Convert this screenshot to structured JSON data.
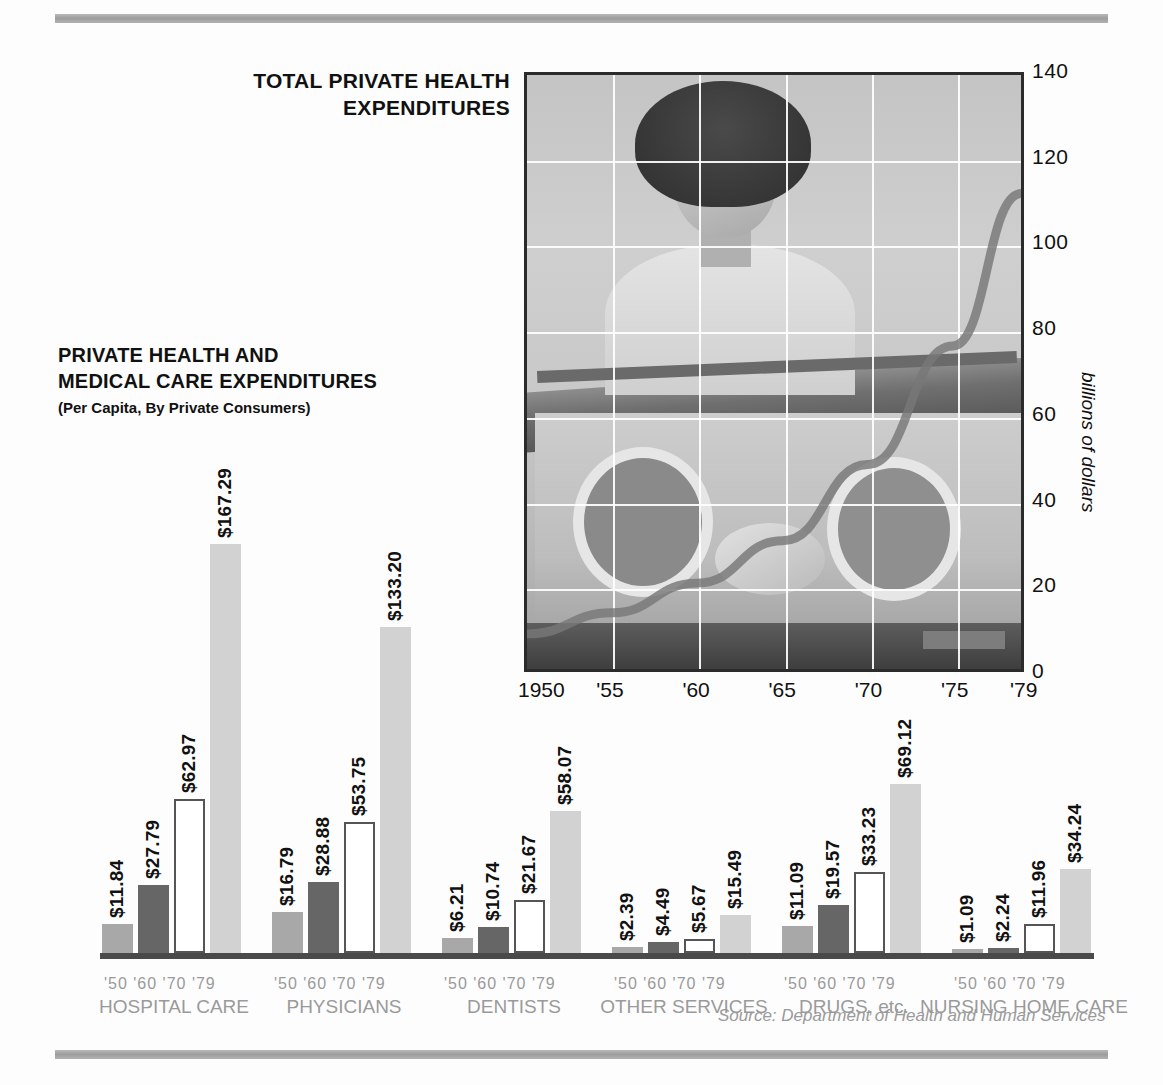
{
  "titles": {
    "line_chart_title": "TOTAL PRIVATE HEALTH EXPENDITURES",
    "bar_chart_title_line1": "PRIVATE HEALTH AND",
    "bar_chart_title_line2": "MEDICAL CARE EXPENDITURES",
    "bar_chart_subtitle": "(Per Capita, By Private Consumers)"
  },
  "source": "Source: Department of Health and Human Services",
  "colors": {
    "rule": "#a9a9a9",
    "frame": "#2b2b2b",
    "bar_1950": "#a8a8a8",
    "bar_1960": "#666666",
    "bar_1970": "#ffffff",
    "bar_1979": "#d2d2d2",
    "label_muted": "#9a9a9a",
    "text": "#111111"
  },
  "chart_data": [
    {
      "type": "line",
      "title": "TOTAL PRIVATE HEALTH EXPENDITURES",
      "xlabel": "",
      "ylabel": "billions of dollars",
      "xlim": [
        1950,
        1979
      ],
      "ylim": [
        0,
        140
      ],
      "yticks": [
        140,
        120,
        100,
        80,
        60,
        40,
        20,
        0
      ],
      "xticks": [
        "1950",
        "'55",
        "'60",
        "'65",
        "'70",
        "'75",
        "'79"
      ],
      "xtick_values": [
        1950,
        1955,
        1960,
        1965,
        1970,
        1975,
        1979
      ],
      "grid": true,
      "legend": "none",
      "series": [
        {
          "name": "Total private health expenditures",
          "x": [
            1950,
            1955,
            1960,
            1965,
            1970,
            1975,
            1979
          ],
          "values": [
            8,
            13,
            20,
            30,
            48,
            76,
            112
          ]
        }
      ],
      "background_image": "photo-nurse-with-infant-incubator"
    },
    {
      "type": "bar",
      "title": "PRIVATE HEALTH AND MEDICAL CARE EXPENDITURES",
      "subtitle": "(Per Capita, By Private Consumers)",
      "xlabel": "",
      "ylabel": "",
      "categories": [
        "HOSPITAL CARE",
        "PHYSICIANS",
        "DENTISTS",
        "OTHER SERVICES",
        "DRUGS, etc.",
        "NURSING HOME CARE"
      ],
      "year_labels": [
        "'50",
        "'60",
        "'70",
        "'79"
      ],
      "series": [
        {
          "name": "'50",
          "values": [
            11.84,
            16.79,
            6.21,
            2.39,
            11.09,
            1.09
          ]
        },
        {
          "name": "'60",
          "values": [
            27.79,
            28.88,
            10.74,
            4.49,
            19.57,
            2.24
          ]
        },
        {
          "name": "'70",
          "values": [
            62.97,
            53.75,
            21.67,
            5.67,
            33.23,
            11.96
          ]
        },
        {
          "name": "'79",
          "values": [
            167.29,
            133.2,
            58.07,
            15.49,
            69.12,
            34.24
          ]
        }
      ],
      "value_labels": [
        [
          "$11.84",
          "$27.79",
          "$62.97",
          "$167.29"
        ],
        [
          "$16.79",
          "$28.88",
          "$53.75",
          "$133.20"
        ],
        [
          "$6.21",
          "$10.74",
          "$21.67",
          "$58.07"
        ],
        [
          "$2.39",
          "$4.49",
          "$5.67",
          "$15.49"
        ],
        [
          "$11.09",
          "$19.57",
          "$33.23",
          "$69.12"
        ],
        [
          "$1.09",
          "$2.24",
          "$11.96",
          "$34.24"
        ]
      ],
      "ylim": [
        0,
        180
      ]
    }
  ]
}
